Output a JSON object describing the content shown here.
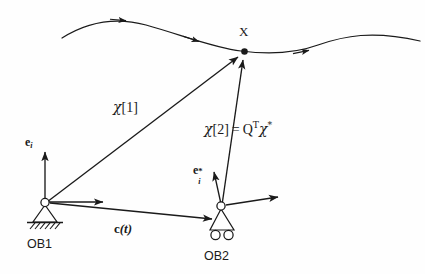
{
  "figure": {
    "background_color": "#fefefe",
    "ink_color": "#1a1a1a"
  },
  "trajectory": {
    "name": "particle-trajectory-curve",
    "description": "smooth wavy path of material point X with three direction arrowheads",
    "arrow_count": 3
  },
  "point": {
    "label": "X",
    "description": "material point marked by a filled dot lying on the trajectory"
  },
  "observers": [
    {
      "id": "ob1",
      "label": "OB1",
      "support_type": "pin-support",
      "basis_label_html": "e<span class=\"sub\">i</span>",
      "basis_label_text": "e_i"
    },
    {
      "id": "ob2",
      "label": "OB2",
      "support_type": "roller-support",
      "basis_label_html": "e<span class=\"sub\">i</span><span class=\"sup\">*</span>",
      "basis_label_text": "e_i*"
    }
  ],
  "vectors": {
    "chi1": {
      "name": "chi-1-vector",
      "greek": "χ",
      "index": "[1]",
      "description": "position vector of X measured in observer frame OB1"
    },
    "chi2": {
      "name": "chi-2-vector",
      "greek": "χ",
      "index": "[2]",
      "equals": "=",
      "matrix": "Q",
      "transpose": "T",
      "starred": "χ",
      "star": "*",
      "description": "position vector of X in observer frame OB2, equal to Q transpose times chi star"
    },
    "c": {
      "name": "c-of-t-vector",
      "symbol": "c",
      "argument": "(t)",
      "description": "relative translation vector from OB1 to OB2 as a function of time"
    }
  }
}
